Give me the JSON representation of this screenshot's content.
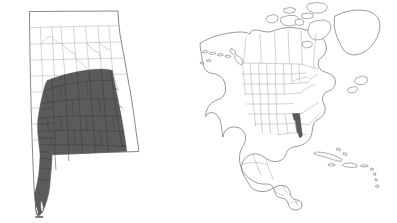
{
  "figure": {
    "kind": "locator-map",
    "panel_count": 2,
    "background_color": "#ffffff"
  },
  "panels": [
    {
      "id": "state-detail",
      "name": "Alabama county map",
      "subject": "Alabama",
      "subject_type": "US state",
      "subdivision_type": "counties",
      "highlight_color": "#5b5b5b",
      "base_fill_color": "#ffffff",
      "outline_color": "#555555",
      "subdivision_line_color": "#a8a8a8",
      "highlight_description": "Southern and central Alabama counties shaded dark gray",
      "highlighted_counties": [
        "Autauga",
        "Baldwin",
        "Barbour",
        "Bullock",
        "Butler",
        "Chilton",
        "Choctaw",
        "Clarke",
        "Coffee",
        "Conecuh",
        "Covington",
        "Crenshaw",
        "Dale",
        "Dallas",
        "Elmore",
        "Escambia",
        "Geneva",
        "Greene",
        "Hale",
        "Henry",
        "Houston",
        "Lee",
        "Lowndes",
        "Macon",
        "Marengo",
        "Mobile",
        "Monroe",
        "Montgomery",
        "Perry",
        "Pike",
        "Russell",
        "Sumter",
        "Tuscaloosa",
        "Washington",
        "Wilcox"
      ],
      "unhighlighted_region": "Northern Alabama counties shown white with light gray county lines"
    },
    {
      "id": "continent-locator",
      "name": "North America locator map",
      "subject": "North America",
      "subject_type": "continent",
      "subdivision_type": "countries and US states",
      "highlight_color": "#5b5b5b",
      "base_fill_color": "#ffffff",
      "outline_color": "#4a4a4a",
      "subdivision_line_color": "#9a9a9a",
      "highlight_description": "Alabama shaded dark gray within the southeastern United States",
      "landmasses": [
        "Alaska",
        "Canada",
        "Greenland",
        "Contiguous United States",
        "Mexico",
        "Central America",
        "Caribbean islands",
        "Aleutian Islands"
      ]
    }
  ],
  "legend": {
    "present": false,
    "items": []
  },
  "labels": {
    "title": "",
    "caption": "",
    "scale_bar": "",
    "north_arrow": false,
    "visible_text": []
  }
}
